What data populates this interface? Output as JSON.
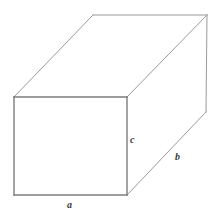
{
  "figure": {
    "name": "rectangular-box",
    "background_color": "#ffffff",
    "edge_color": "#8a8a8a",
    "edge_color_dark": "#6f6f6f",
    "label_color": "#3a3a3a",
    "edge_width": 1
  },
  "labels": {
    "a": "a",
    "b": "b",
    "c": "c"
  },
  "geometry": {
    "front_top_left": [
      14,
      97
    ],
    "front_top_right": [
      127,
      97
    ],
    "front_bottom_left": [
      14,
      195
    ],
    "front_bottom_right": [
      127,
      195
    ],
    "back_top_left": [
      93,
      15
    ],
    "back_top_right": [
      207,
      15
    ],
    "back_bottom_right": [
      206,
      112
    ],
    "front_face_points": "14,97 127,97 127,195 14,195",
    "top_face_points": "14,97 93,15 207,15 127,97",
    "right_face_points": "127,97 207,15 206,112 127,195",
    "edges": [
      {
        "name": "front-top-edge",
        "d": "M14,97 L127,97"
      },
      {
        "name": "front-right-edge",
        "d": "M127,97 L127,195"
      },
      {
        "name": "front-bottom-edge",
        "d": "M14,195 L127,195"
      },
      {
        "name": "front-left-edge",
        "d": "M14,97 L14,195"
      },
      {
        "name": "top-left-diagonal-edge",
        "d": "M14,97 L93,15"
      },
      {
        "name": "back-top-edge",
        "d": "M93,15 L207,15"
      },
      {
        "name": "top-right-diagonal-edge",
        "d": "M127,97 L207,15"
      },
      {
        "name": "back-right-vertical-edge",
        "d": "M207,15 L206,112"
      },
      {
        "name": "bottom-right-diagonal-edge",
        "d": "M127,195 L206,112"
      }
    ]
  }
}
